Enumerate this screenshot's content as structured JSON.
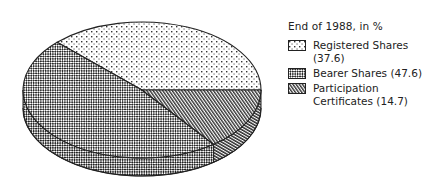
{
  "chart_data": {
    "type": "pie",
    "style": "3d-pie-monochrome-hatched",
    "title": "End of 1988, in %",
    "categories": [
      "Registered Shares",
      "Bearer Shares",
      "Participation Certificates"
    ],
    "values": [
      37.6,
      47.6,
      14.7
    ],
    "unit": "%",
    "legend_position": "right",
    "series": [
      {
        "name": "Registered Shares",
        "value": 37.6,
        "pattern": "dots",
        "legend_label": "Registered Shares (37.6)"
      },
      {
        "name": "Bearer Shares",
        "value": 47.6,
        "pattern": "crosshatch",
        "legend_label": "Bearer Shares (47.6)"
      },
      {
        "name": "Participation Certificates",
        "value": 14.7,
        "pattern": "dense-diagonal",
        "legend_label_line1": "Participation",
        "legend_label_line2": "Certificates (14.7)"
      }
    ]
  },
  "legend": {
    "title": "End of 1988, in %",
    "items": [
      {
        "label": "Registered Shares (37.6)",
        "icon": "dots-pattern-swatch"
      },
      {
        "label": "Bearer Shares (47.6)",
        "icon": "crosshatch-pattern-swatch"
      },
      {
        "label_line1": "Participation",
        "label_line2": "Certificates (14.7)",
        "icon": "diagonal-hatch-pattern-swatch"
      }
    ]
  },
  "colors": {
    "ink": "#222222",
    "background": "#ffffff"
  }
}
